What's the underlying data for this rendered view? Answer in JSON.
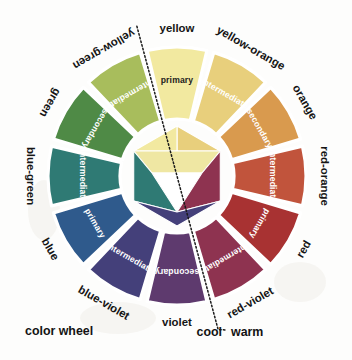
{
  "figure": {
    "title": "color wheel",
    "caption_left": "color wheel",
    "caption_cool": "cool",
    "caption_warm": "warm",
    "background_color": "#fdfdfc",
    "divider_note": "dotted line separating cool and warm halves"
  },
  "geometry": {
    "center_x": 177,
    "center_y": 176,
    "outer_radius": 129,
    "inner_radius": 57,
    "hex_radius": 50,
    "wedge_count": 12,
    "wedge_gap_degrees": 3.2
  },
  "chart_data": {
    "type": "pie",
    "title": "color wheel",
    "categories": [
      "yellow",
      "yellow-orange",
      "orange",
      "red-orange",
      "red",
      "red-violet",
      "violet",
      "blue-violet",
      "blue",
      "blue-green",
      "green",
      "yellow-green"
    ],
    "values": [
      30,
      30,
      30,
      30,
      30,
      30,
      30,
      30,
      30,
      30,
      30,
      30
    ],
    "legend": [
      "primary",
      "secondary",
      "intermediate"
    ],
    "legend_position": "in-wedge",
    "grid": false
  },
  "wheel": {
    "segments": [
      {
        "name": "yellow",
        "label": "yellow",
        "role": "primary",
        "color": "#f2e9a0",
        "role_text_color": "#1c1c1c",
        "angle_center": -90,
        "label_rotation": 0,
        "temperature": "warm"
      },
      {
        "name": "yellow-orange",
        "label": "yellow-orange",
        "role": "intermediate",
        "color": "#e8cf7c",
        "role_text_color": "#ffffff",
        "angle_center": -60,
        "label_rotation": -60,
        "temperature": "warm"
      },
      {
        "name": "orange",
        "label": "orange",
        "role": "secondary",
        "color": "#d99a4e",
        "role_text_color": "#ffffff",
        "angle_center": -30,
        "label_rotation": -30,
        "temperature": "warm"
      },
      {
        "name": "red-orange",
        "label": "red-orange",
        "role": "intermediate",
        "color": "#c1543c",
        "role_text_color": "#ffffff",
        "angle_center": 0,
        "label_rotation": 0,
        "temperature": "warm"
      },
      {
        "name": "red",
        "label": "red",
        "role": "primary",
        "color": "#a83232",
        "role_text_color": "#ffffff",
        "angle_center": 30,
        "label_rotation": 30,
        "temperature": "warm"
      },
      {
        "name": "red-violet",
        "label": "red-violet",
        "role": "intermediate",
        "color": "#8e3350",
        "role_text_color": "#ffffff",
        "angle_center": 60,
        "label_rotation": 60,
        "temperature": "warm"
      },
      {
        "name": "violet",
        "label": "violet",
        "role": "secondary",
        "color": "#5e3a6e",
        "role_text_color": "#ffffff",
        "angle_center": 90,
        "label_rotation": 0,
        "temperature": "cool"
      },
      {
        "name": "blue-violet",
        "label": "blue-violet",
        "role": "intermediate",
        "color": "#44407a",
        "role_text_color": "#ffffff",
        "angle_center": 120,
        "label_rotation": -60,
        "temperature": "cool"
      },
      {
        "name": "blue",
        "label": "blue",
        "role": "primary",
        "color": "#2f5a8c",
        "role_text_color": "#ffffff",
        "angle_center": 150,
        "label_rotation": -30,
        "temperature": "cool"
      },
      {
        "name": "blue-green",
        "label": "blue-green",
        "role": "intermediate",
        "color": "#2f7a74",
        "role_text_color": "#ffffff",
        "angle_center": 180,
        "label_rotation": 0,
        "temperature": "cool"
      },
      {
        "name": "green",
        "label": "green",
        "role": "secondary",
        "color": "#4f8a46",
        "role_text_color": "#ffffff",
        "angle_center": 210,
        "label_rotation": 30,
        "temperature": "cool"
      },
      {
        "name": "yellow-green",
        "label": "yellow-green",
        "role": "intermediate",
        "color": "#a8bd5c",
        "role_text_color": "#ffffff",
        "angle_center": 240,
        "label_rotation": 60,
        "temperature": "cool"
      }
    ]
  },
  "center_diagram": {
    "description": "hexagon of primary and secondary triangles with white inner triangle",
    "primary_triangle_color_top": "#f2e9a0",
    "hex_facets": [
      {
        "name": "hex-top-left-yellow",
        "color": "#e5dc93"
      },
      {
        "name": "hex-top-right-yellow",
        "color": "#d9cf86"
      },
      {
        "name": "hex-right-red",
        "color": "#a83232"
      },
      {
        "name": "hex-bottom-right-violet",
        "color": "#5e3a6e"
      },
      {
        "name": "hex-bottom-left-blue",
        "color": "#2f5a8c"
      },
      {
        "name": "hex-left-green",
        "color": "#4f8a46"
      },
      {
        "name": "hex-center-white",
        "color": "#ffffff"
      },
      {
        "name": "hex-upper-band",
        "color": "#efe7a3"
      }
    ]
  }
}
